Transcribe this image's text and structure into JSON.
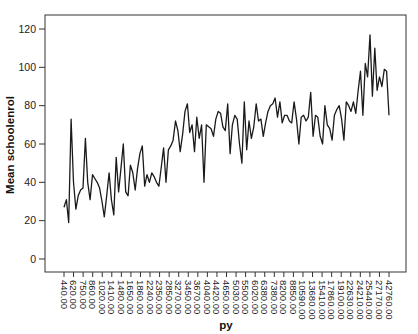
{
  "chart_data": {
    "type": "line",
    "title": "",
    "xlabel": "py",
    "ylabel": "Mean schoolenrol",
    "ylim": [
      0,
      120
    ],
    "yticks": [
      0,
      20,
      40,
      60,
      80,
      100,
      120
    ],
    "grid": false,
    "legend": null,
    "x_tick_labels": [
      "440.00",
      "620.00",
      "750.00",
      "860.00",
      "1020.00",
      "1410.00",
      "1480.00",
      "1650.00",
      "1860.00",
      "2240.00",
      "2350.00",
      "2850.00",
      "3270.00",
      "3450.00",
      "3670.00",
      "4040.00",
      "4420.00",
      "4650.00",
      "5030.00",
      "5500.00",
      "6020.00",
      "6380.00",
      "7380.00",
      "8200.00",
      "8850.00",
      "10590.00",
      "13680.00",
      "15410.00",
      "17860.00",
      "19100.00",
      "22630.00",
      "24210.00",
      "25440.00",
      "27170.00",
      "42760.00"
    ],
    "series": [
      {
        "name": "Mean schoolenrol",
        "color": "#1a1a1a",
        "values": [
          27,
          31,
          19,
          73,
          40,
          26,
          33,
          36,
          37,
          63,
          40,
          31,
          44,
          42,
          40,
          37,
          30,
          22,
          33,
          45,
          31,
          23,
          53,
          35,
          47,
          60,
          35,
          33,
          49,
          45,
          36,
          47,
          55,
          59,
          38,
          44,
          40,
          45,
          43,
          40,
          38,
          48,
          58,
          40,
          57,
          59,
          62,
          72,
          67,
          56,
          65,
          77,
          81,
          66,
          70,
          56,
          74,
          63,
          70,
          40,
          70,
          69,
          68,
          64,
          73,
          77,
          76,
          69,
          67,
          81,
          55,
          70,
          75,
          73,
          60,
          50,
          82,
          57,
          72,
          63,
          69,
          81,
          72,
          73,
          64,
          71,
          77,
          80,
          81,
          84,
          74,
          82,
          71,
          75,
          75,
          72,
          71,
          82,
          73,
          60,
          74,
          75,
          72,
          74,
          87,
          64,
          75,
          74,
          64,
          60,
          80,
          70,
          68,
          62,
          75,
          78,
          80,
          73,
          62,
          82,
          80,
          77,
          82,
          76,
          88,
          98,
          75,
          102,
          95,
          117
        ]
      }
    ],
    "tail_values": [
      85,
      110,
      88,
      95,
      90,
      99,
      98,
      75
    ]
  }
}
